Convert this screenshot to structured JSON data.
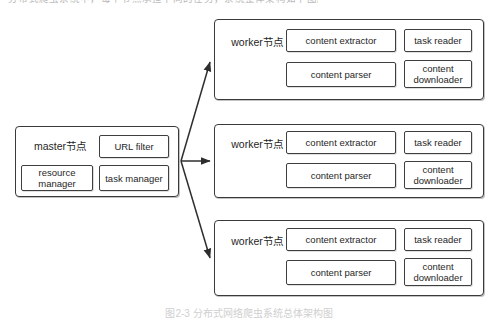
{
  "figure": {
    "background_color": "#ffffff",
    "line_color": "#3a3a3a",
    "text_color": "#1f1f1f",
    "top_cropped_line": "分布式爬虫系统中，每个节点承担不同的任务，系统整体架构如下图所示。",
    "caption": "图2-3  分布式网络爬虫系统总体架构图"
  },
  "master": {
    "label": "master节点",
    "components": [
      {
        "label": "URL filter"
      },
      {
        "label": "resource manager"
      },
      {
        "label": "task manager"
      }
    ]
  },
  "workers": [
    {
      "label": "worker节点",
      "components": [
        {
          "label": "content extractor"
        },
        {
          "label": "task reader"
        },
        {
          "label": "content parser"
        },
        {
          "label": "content downloader"
        }
      ]
    },
    {
      "label": "worker节点",
      "components": [
        {
          "label": "content extractor"
        },
        {
          "label": "task reader"
        },
        {
          "label": "content parser"
        },
        {
          "label": "content downloader"
        }
      ]
    },
    {
      "label": "worker节点",
      "components": [
        {
          "label": "content extractor"
        },
        {
          "label": "task reader"
        },
        {
          "label": "content parser"
        },
        {
          "label": "content downloader"
        }
      ]
    }
  ],
  "connections": [
    {
      "from": "master",
      "to": "worker-node-1",
      "style": "arrow"
    },
    {
      "from": "master",
      "to": "worker-node-2",
      "style": "arrow"
    },
    {
      "from": "master",
      "to": "worker-node-3",
      "style": "arrow"
    }
  ]
}
